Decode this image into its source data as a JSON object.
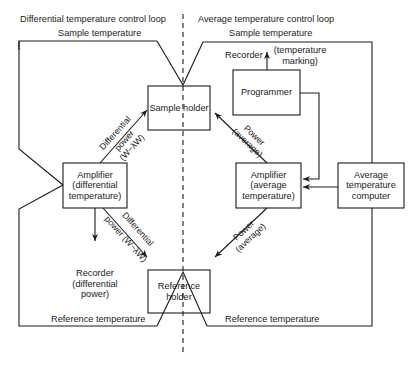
{
  "diagram": {
    "loops": {
      "differential": {
        "title": "Differential temperature control loop"
      },
      "average": {
        "title": "Average temperature control loop"
      }
    },
    "signals": {
      "sample_temp_left": "Sample temperature",
      "sample_temp_right": "Sample temperature",
      "reference_temp_left": "Reference temperature",
      "reference_temp_right": "Reference temperature"
    },
    "blocks": {
      "sample_holder": "Sample holder",
      "reference_holder": {
        "line1": "Reference",
        "line2": "holder"
      },
      "amp_differential": {
        "line1": "Amplifier",
        "line2": "(differential",
        "line3": "temperature)"
      },
      "amp_average": {
        "line1": "Amplifier",
        "line2": "(average",
        "line3": "temperature)"
      },
      "programmer": "Programmer",
      "avg_temp_computer": {
        "line1": "Average",
        "line2": "temperature",
        "line3": "computer"
      }
    },
    "outputs": {
      "recorder_top": {
        "label": "Recorder",
        "note_line1": "(temperature",
        "note_line2": "marking)"
      },
      "recorder_bottom": {
        "line1": "Recorder",
        "line2": "(differential",
        "line3": "power)"
      }
    },
    "edges": {
      "diff_power_up": {
        "line1": "Differential",
        "line2": "power",
        "line3": "(W−λW)"
      },
      "diff_power_down": {
        "line1": "Differential",
        "line2": "power (W−λW)"
      },
      "avg_power_up": {
        "line1": "Power",
        "line2": "(average)"
      },
      "avg_power_down": {
        "line1": "Power",
        "line2": "(average)"
      }
    },
    "colors": {
      "line": "#1c1c1c",
      "background": "#ffffff"
    }
  }
}
